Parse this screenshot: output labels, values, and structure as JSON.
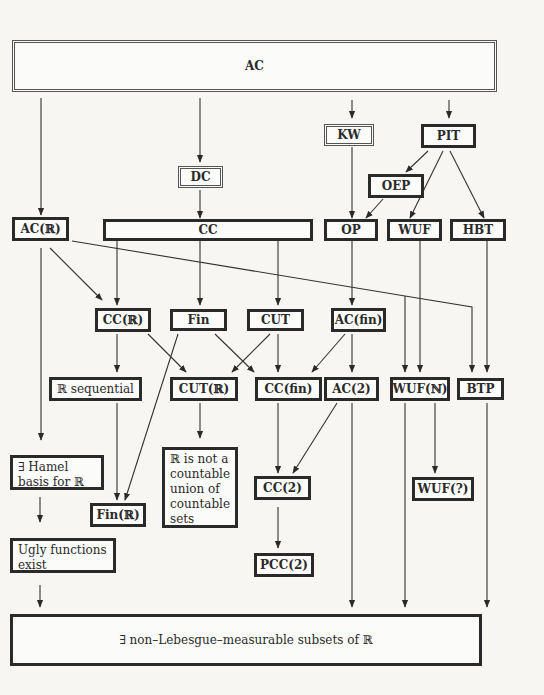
{
  "diagram": {
    "nodes": {
      "ac": "AC",
      "dc": "DC",
      "kw": "KW",
      "pit": "PIT",
      "oep": "OEP",
      "ac_r": "AC(ℝ)",
      "cc": "CC",
      "op": "OP",
      "wuf": "WUF",
      "hbt": "HBT",
      "cc_r": "CC(ℝ)",
      "fin": "Fin",
      "cut": "CUT",
      "ac_fin": "AC(fin)",
      "r_sequential": "ℝ sequential",
      "cut_r": "CUT(ℝ)",
      "cc_fin": "CC(fin)",
      "ac_2": "AC(2)",
      "wuf_n": "WUF(ℕ)",
      "btp": "BTP",
      "hamel": "∃ Hamel basis for ℝ",
      "fin_r": "Fin(ℝ)",
      "r_not_countable_union": "ℝ is not a countable union of countable sets",
      "cc_2": "CC(2)",
      "wuf_q": "WUF(?)",
      "ugly": "Ugly functions exist",
      "pcc_2": "PCC(2)",
      "non_measurable": "∃ non–Lebesgue–measurable subsets of ℝ"
    },
    "edges": [
      [
        "AC",
        "AC(ℝ)"
      ],
      [
        "AC",
        "DC"
      ],
      [
        "AC",
        "KW"
      ],
      [
        "AC",
        "PIT"
      ],
      [
        "DC",
        "CC"
      ],
      [
        "KW",
        "OP"
      ],
      [
        "PIT",
        "OEP"
      ],
      [
        "PIT",
        "WUF"
      ],
      [
        "PIT",
        "HBT"
      ],
      [
        "OEP",
        "OP"
      ],
      [
        "AC(ℝ)",
        "CC(ℝ)"
      ],
      [
        "AC(ℝ)",
        "∃ Hamel basis for ℝ"
      ],
      [
        "AC(ℝ)",
        "WUF(ℕ)"
      ],
      [
        "AC(ℝ)",
        "BTP"
      ],
      [
        "CC",
        "CC(ℝ)"
      ],
      [
        "CC",
        "Fin"
      ],
      [
        "CC",
        "CUT"
      ],
      [
        "OP",
        "AC(fin)"
      ],
      [
        "WUF",
        "WUF(ℕ)"
      ],
      [
        "HBT",
        "BTP"
      ],
      [
        "CC(ℝ)",
        "ℝ sequential"
      ],
      [
        "CC(ℝ)",
        "CUT(ℝ)"
      ],
      [
        "Fin",
        "Fin(ℝ)"
      ],
      [
        "Fin",
        "CC(fin)"
      ],
      [
        "CUT",
        "CUT(ℝ)"
      ],
      [
        "CUT",
        "CC(fin)"
      ],
      [
        "AC(fin)",
        "CC(fin)"
      ],
      [
        "AC(fin)",
        "AC(2)"
      ],
      [
        "ℝ sequential",
        "Fin(ℝ)"
      ],
      [
        "CUT(ℝ)",
        "ℝ is not a countable union of countable sets"
      ],
      [
        "CC(fin)",
        "CC(2)"
      ],
      [
        "AC(2)",
        "CC(2)"
      ],
      [
        "AC(2)",
        "∃ non–Lebesgue–measurable subsets of ℝ"
      ],
      [
        "WUF(ℕ)",
        "WUF(?)"
      ],
      [
        "WUF(ℕ)",
        "∃ non–Lebesgue–measurable subsets of ℝ"
      ],
      [
        "BTP",
        "∃ non–Lebesgue–measurable subsets of ℝ"
      ],
      [
        "∃ Hamel basis for ℝ",
        "Ugly functions exist"
      ],
      [
        "Ugly functions exist",
        "∃ non–Lebesgue–measurable subsets of ℝ"
      ],
      [
        "CC(2)",
        "PCC(2)"
      ]
    ]
  }
}
